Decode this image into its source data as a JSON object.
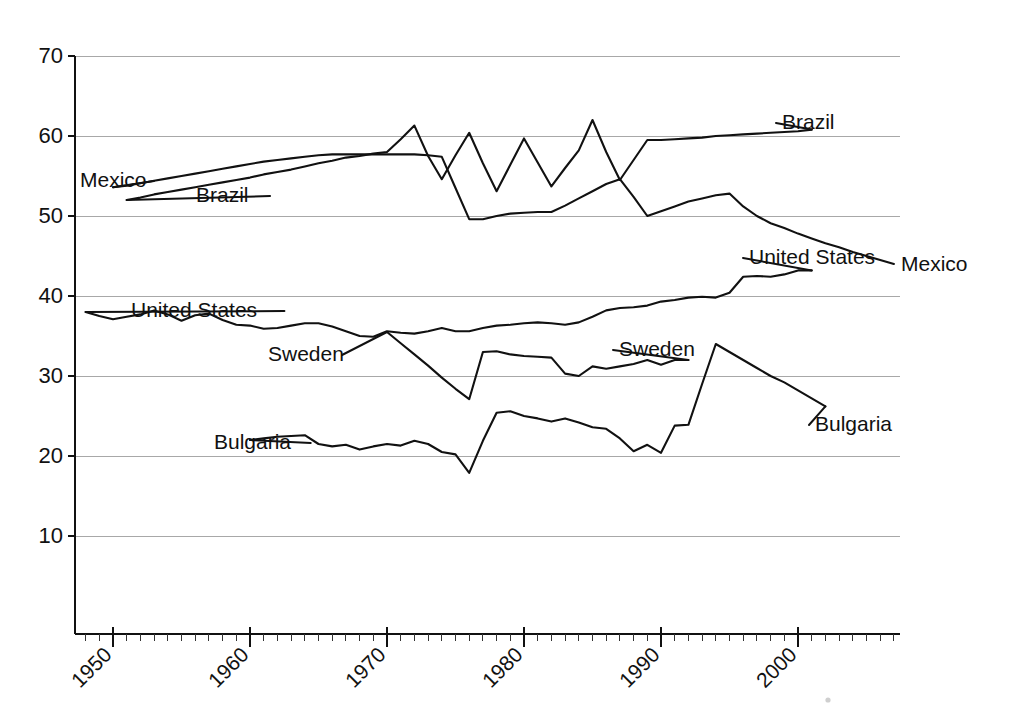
{
  "chart_data": {
    "type": "line",
    "title": "",
    "subtitle": "",
    "xlabel": "",
    "ylabel": "",
    "xlim": [
      1947,
      2008
    ],
    "ylim": [
      0,
      70
    ],
    "grid": true,
    "grid_axis": "y",
    "legend": "inline-labels",
    "y_ticks": [
      10,
      20,
      30,
      40,
      50,
      60,
      70
    ],
    "y_tick_labels": [
      "10",
      "20",
      "30",
      "40",
      "50",
      "60",
      "70"
    ],
    "x_ticks": [
      1950,
      1960,
      1970,
      1980,
      1990,
      2000
    ],
    "x_tick_labels": [
      "1950",
      "1960",
      "1970",
      "1980",
      "1990",
      "2000"
    ],
    "x_minor_tick_step": 1,
    "line_color": "#111111",
    "grid_color": "#a8a8a8",
    "series": [
      {
        "name": "Mexico",
        "label": "Mexico",
        "x": [
          1950,
          1951,
          1952,
          1953,
          1954,
          1955,
          1956,
          1957,
          1958,
          1959,
          1960,
          1961,
          1962,
          1963,
          1964,
          1965,
          1966,
          1967,
          1968,
          1969,
          1970,
          1971,
          1972,
          1973,
          1974,
          1975,
          1976,
          1977,
          1978,
          1979,
          1980,
          1981,
          1982,
          1983,
          1984,
          1985,
          1986,
          1987,
          1988,
          1989,
          1990,
          1991,
          1992,
          1993,
          1994,
          1995,
          1996,
          1997,
          1998,
          1999,
          2000,
          2001,
          2002,
          2003,
          2004,
          2005,
          2006,
          2007
        ],
        "y": [
          53.6,
          53.8,
          54.1,
          54.4,
          54.7,
          55.0,
          55.3,
          55.6,
          55.9,
          56.2,
          56.5,
          56.8,
          57.0,
          57.2,
          57.4,
          57.6,
          57.7,
          57.7,
          57.7,
          57.7,
          57.7,
          57.7,
          57.7,
          57.6,
          57.4,
          53.5,
          49.6,
          49.6,
          50.0,
          50.3,
          50.4,
          50.5,
          50.5,
          51.3,
          52.2,
          53.1,
          54.0,
          54.6,
          52.4,
          50.0,
          50.6,
          51.2,
          51.8,
          52.2,
          52.6,
          52.8,
          51.2,
          50.0,
          49.1,
          48.5,
          47.8,
          47.2,
          46.6,
          46.1,
          45.5,
          45.0,
          44.5,
          44.0
        ]
      },
      {
        "name": "Brazil",
        "label": "Brazil",
        "x": [
          1951,
          1952,
          1953,
          1954,
          1955,
          1956,
          1957,
          1958,
          1959,
          1960,
          1961,
          1962,
          1963,
          1964,
          1965,
          1966,
          1967,
          1968,
          1969,
          1970,
          1971,
          1972,
          1973,
          1974,
          1975,
          1976,
          1977,
          1978,
          1979,
          1980,
          1981,
          1982,
          1983,
          1984,
          1985,
          1986,
          1987,
          1988,
          1989,
          1990,
          1991,
          1992,
          1993,
          1994,
          1995,
          1996,
          1997,
          1998,
          1999,
          2000,
          2001
        ],
        "y": [
          52.0,
          52.3,
          52.7,
          53.0,
          53.3,
          53.6,
          53.9,
          54.2,
          54.5,
          54.8,
          55.2,
          55.5,
          55.8,
          56.2,
          56.6,
          56.9,
          57.3,
          57.5,
          57.8,
          58.0,
          59.6,
          61.3,
          57.5,
          54.6,
          57.6,
          60.4,
          56.6,
          53.1,
          56.4,
          59.7,
          56.7,
          53.7,
          56.0,
          58.2,
          62.0,
          58.0,
          54.5,
          57.0,
          59.5,
          59.5,
          59.6,
          59.7,
          59.8,
          60.0,
          60.1,
          60.2,
          60.3,
          60.4,
          60.5,
          60.6,
          60.8
        ]
      },
      {
        "name": "United States",
        "label": "United States",
        "x": [
          1948,
          1949,
          1950,
          1951,
          1952,
          1953,
          1954,
          1955,
          1956,
          1957,
          1958,
          1959,
          1960,
          1961,
          1962,
          1963,
          1964,
          1965,
          1966,
          1967,
          1968,
          1969,
          1970,
          1971,
          1972,
          1973,
          1974,
          1975,
          1976,
          1977,
          1978,
          1979,
          1980,
          1981,
          1982,
          1983,
          1984,
          1985,
          1986,
          1987,
          1988,
          1989,
          1990,
          1991,
          1992,
          1993,
          1994,
          1995,
          1996,
          1997,
          1998,
          1999,
          2000,
          2001
        ],
        "y": [
          38.0,
          37.5,
          37.1,
          37.4,
          37.7,
          38.2,
          37.7,
          36.9,
          37.6,
          37.8,
          37.0,
          36.4,
          36.3,
          35.9,
          36.0,
          36.3,
          36.6,
          36.6,
          36.2,
          35.6,
          35.0,
          34.9,
          35.6,
          35.4,
          35.3,
          35.6,
          36.0,
          35.6,
          35.6,
          36.0,
          36.3,
          36.4,
          36.6,
          36.7,
          36.6,
          36.4,
          36.7,
          37.4,
          38.2,
          38.5,
          38.6,
          38.8,
          39.3,
          39.5,
          39.8,
          39.9,
          39.8,
          40.4,
          42.4,
          42.5,
          42.4,
          42.7,
          43.2,
          43.2
        ]
      },
      {
        "name": "Sweden",
        "label": "Sweden",
        "x": [
          1970,
          1971,
          1972,
          1973,
          1974,
          1975,
          1976,
          1977,
          1978,
          1979,
          1980,
          1981,
          1982,
          1983,
          1984,
          1985,
          1986,
          1987,
          1988,
          1989,
          1990,
          1991,
          1992
        ],
        "y": [
          35.5,
          34.1,
          32.7,
          31.3,
          29.8,
          28.4,
          27.1,
          33.0,
          33.1,
          32.7,
          32.5,
          32.4,
          32.3,
          30.3,
          30.0,
          31.2,
          30.9,
          31.2,
          31.5,
          32.0,
          31.4,
          32.0,
          32.0
        ]
      },
      {
        "name": "Bulgaria",
        "label": "Bulgaria",
        "x": [
          1960,
          1961,
          1962,
          1963,
          1964,
          1965,
          1966,
          1967,
          1968,
          1969,
          1970,
          1971,
          1972,
          1973,
          1974,
          1975,
          1976,
          1977,
          1978,
          1979,
          1980,
          1981,
          1982,
          1983,
          1984,
          1985,
          1986,
          1987,
          1988,
          1989,
          1990,
          1991,
          1992,
          1993,
          1994,
          1995,
          1996,
          1997,
          1998,
          1999,
          2000,
          2001,
          2002
        ],
        "y": [
          22.0,
          22.2,
          22.4,
          22.5,
          22.6,
          21.5,
          21.2,
          21.4,
          20.8,
          21.2,
          21.5,
          21.3,
          21.9,
          21.5,
          20.5,
          20.2,
          17.9,
          21.9,
          25.4,
          25.6,
          25.0,
          24.7,
          24.3,
          24.7,
          24.2,
          23.6,
          23.4,
          22.2,
          20.6,
          21.4,
          20.4,
          23.8,
          23.9,
          29.0,
          34.0,
          33.0,
          32.0,
          31.0,
          30.0,
          29.2,
          28.2,
          27.2,
          26.2
        ]
      }
    ],
    "annotations": [
      {
        "name": "Mexico",
        "text": "Mexico",
        "side": "left",
        "x_text": 80,
        "y_text": 181
      },
      {
        "name": "Brazil",
        "text": "Brazil",
        "side": "left",
        "x_text": 196,
        "y_text": 196
      },
      {
        "name": "Brazil",
        "text": "Brazil",
        "side": "right",
        "x_text": 782,
        "y_text": 123
      },
      {
        "name": "Mexico",
        "text": "Mexico",
        "side": "right",
        "x_text": 901,
        "y_text": 265
      },
      {
        "name": "United States",
        "text": "United States",
        "side": "left",
        "x_text": 131,
        "y_text": 311
      },
      {
        "name": "United States",
        "text": "United States",
        "side": "right",
        "x_text": 749,
        "y_text": 258
      },
      {
        "name": "Sweden",
        "text": "Sweden",
        "side": "left",
        "x_text": 268,
        "y_text": 355
      },
      {
        "name": "Sweden",
        "text": "Sweden",
        "side": "right",
        "x_text": 619,
        "y_text": 350
      },
      {
        "name": "Bulgaria",
        "text": "Bulgaria",
        "side": "left",
        "x_text": 214,
        "y_text": 443
      },
      {
        "name": "Bulgaria",
        "text": "Bulgaria",
        "side": "right",
        "x_text": 815,
        "y_text": 425
      }
    ]
  },
  "geometry": {
    "x_of_1950_px": 113,
    "px_per_year": 13.7,
    "y_of_0_px": 616,
    "px_per_unit": 8.0,
    "plot_left_px": 75,
    "plot_right_px": 900,
    "axis_bottom_px": 634
  }
}
